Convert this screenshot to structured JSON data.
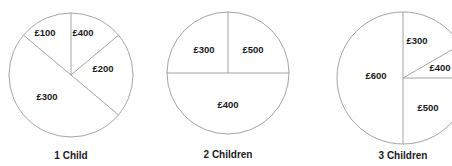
{
  "figure": {
    "partial_top_text": "",
    "background_color": "#ffffff",
    "stroke_color": "#9a9a9a",
    "text_color": "#1b1b1b",
    "width": 452,
    "height": 166
  },
  "chart_data": [
    {
      "type": "pie",
      "title": "1 Child",
      "categories": [
        "£400",
        "£200",
        "£300",
        "£100"
      ],
      "values": [
        400,
        200,
        300,
        100
      ],
      "data_labels": [
        "£400",
        "£200",
        "£300",
        "£100"
      ],
      "start_angle_deg": 0,
      "direction": "clockwise",
      "legend": "none",
      "grid": false,
      "center": {
        "x": 71,
        "y": 75
      },
      "radius": 62,
      "slices": [
        {
          "label": "£400",
          "value": 400,
          "start_deg": 0,
          "end_deg": 50,
          "label_x": 83,
          "label_y": 32
        },
        {
          "label": "£200",
          "value": 200,
          "start_deg": 50,
          "end_deg": 130,
          "label_x": 103,
          "label_y": 68
        },
        {
          "label": "£300",
          "value": 300,
          "start_deg": 130,
          "end_deg": 310,
          "label_x": 47,
          "label_y": 96
        },
        {
          "label": "£100",
          "value": 100,
          "start_deg": 310,
          "end_deg": 360,
          "label_x": 45,
          "label_y": 32
        }
      ]
    },
    {
      "type": "pie",
      "title": "2 Children",
      "categories": [
        "£500",
        "£400",
        "£300"
      ],
      "values": [
        500,
        400,
        300
      ],
      "data_labels": [
        "£500",
        "£400",
        "£300"
      ],
      "start_angle_deg": 0,
      "direction": "clockwise",
      "legend": "none",
      "grid": false,
      "center": {
        "x": 228,
        "y": 73
      },
      "radius": 61,
      "slices": [
        {
          "label": "£500",
          "value": 500,
          "start_deg": 0,
          "end_deg": 90,
          "label_x": 253,
          "label_y": 49
        },
        {
          "label": "£400",
          "value": 400,
          "start_deg": 90,
          "end_deg": 270,
          "label_x": 228,
          "label_y": 104
        },
        {
          "label": "£300",
          "value": 300,
          "start_deg": 270,
          "end_deg": 360,
          "label_x": 204,
          "label_y": 49
        }
      ]
    },
    {
      "type": "pie",
      "title": "3 Children",
      "categories": [
        "£300",
        "£400",
        "£500",
        "£600"
      ],
      "values": [
        300,
        400,
        500,
        600
      ],
      "data_labels": [
        "£300",
        "£400",
        "£500",
        "£600"
      ],
      "start_angle_deg": 0,
      "direction": "clockwise",
      "legend": "none",
      "grid": false,
      "center": {
        "x": 403,
        "y": 78
      },
      "radius": 66,
      "slices": [
        {
          "label": "£300",
          "value": 300,
          "start_deg": 0,
          "end_deg": 60,
          "label_x": 417,
          "label_y": 40
        },
        {
          "label": "£400",
          "value": 400,
          "start_deg": 60,
          "end_deg": 90,
          "label_x": 440,
          "label_y": 67
        },
        {
          "label": "£500",
          "value": 500,
          "start_deg": 90,
          "end_deg": 180,
          "label_x": 428,
          "label_y": 107
        },
        {
          "label": "£600",
          "value": 600,
          "start_deg": 180,
          "end_deg": 360,
          "label_x": 376,
          "label_y": 75
        }
      ]
    }
  ],
  "captions": [
    {
      "text": "1 Child",
      "x": 71,
      "y": 150
    },
    {
      "text": "2 Children",
      "x": 228,
      "y": 149
    },
    {
      "text": "3 Children",
      "x": 403,
      "y": 150
    }
  ]
}
